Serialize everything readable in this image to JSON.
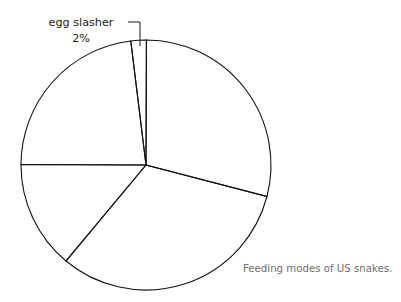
{
  "figure": {
    "caption": "Feeding modes of US snakes.",
    "background_color": "#ffffff",
    "caption_color": "#6f6f6f"
  },
  "chart_data": {
    "type": "pie",
    "title": "Feeding modes of US snakes.",
    "xlabel": "",
    "ylabel": "",
    "units": "percent",
    "total": 100,
    "legend": "none (direct slice labels)",
    "grid": false,
    "start_angle_deg": -97,
    "direction": "clockwise",
    "categories": [
      "egg slasher",
      "constriction",
      "direct swallow",
      "mild venom/direct swallow",
      "venom"
    ],
    "values": [
      2,
      29,
      32,
      14,
      23
    ],
    "value_labels": [
      "2%",
      "29%",
      "32%",
      "14%",
      "23%"
    ],
    "colors": [
      "#9a9a9a",
      "#6e6e6e",
      "#3b3b3b",
      "#c3c3c3",
      "#4f4f4f"
    ],
    "slices": [
      {
        "name": "egg slasher",
        "value": 2,
        "value_label": "2%",
        "color": "#9a9a9a",
        "label_placement": "outside-callout",
        "label_line1": "egg slasher",
        "label_line2": "2%",
        "label_color": "#1a1a1a"
      },
      {
        "name": "constriction",
        "value": 29,
        "value_label": "29%",
        "color": "#6e6e6e",
        "label_placement": "inside",
        "label_line1": "constriction",
        "label_line2": "29%",
        "label_color": "#ffffff"
      },
      {
        "name": "direct swallow",
        "value": 32,
        "value_label": "32%",
        "color": "#3b3b3b",
        "label_placement": "inside",
        "label_line1": "direct swallow",
        "label_line2": "32%",
        "label_color": "#ffffff"
      },
      {
        "name": "mild venom/direct swallow",
        "value": 14,
        "value_label": "14%",
        "color": "#c3c3c3",
        "label_placement": "inside",
        "label_line1": "mild venom/direct",
        "label_line2": "swallow",
        "label_line3": "14%",
        "label_color": "#ffffff"
      },
      {
        "name": "venom",
        "value": 23,
        "value_label": "23%",
        "color": "#4f4f4f",
        "label_placement": "inside",
        "label_line1": "venom",
        "label_line2": "23%",
        "label_color": "#ffffff"
      }
    ]
  }
}
